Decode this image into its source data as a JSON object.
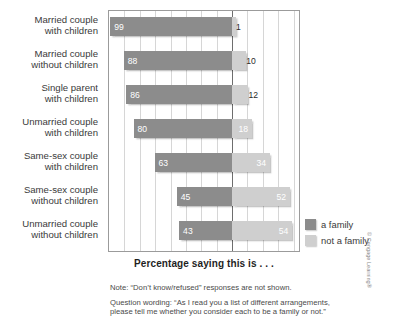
{
  "chart_data": {
    "type": "bar",
    "subtype": "diverging-horizontal-paired",
    "title": "",
    "xlabel": "Percentage saying this is . . .",
    "ylabel": "",
    "categories": [
      "Married couple with children",
      "Married couple without children",
      "Single parent with children",
      "Unmarried couple with children",
      "Same-sex couple with children",
      "Same-sex couple without children",
      "Unmarried couple without children"
    ],
    "series": [
      {
        "name": "a family",
        "color": "#8c8c8c",
        "direction": "left",
        "values": [
          99,
          88,
          86,
          80,
          63,
          45,
          43
        ]
      },
      {
        "name": "not a family",
        "color": "#cfcfcf",
        "direction": "right",
        "values": [
          1,
          10,
          12,
          18,
          34,
          52,
          54
        ]
      }
    ],
    "axis_max_left": 100,
    "axis_max_right": 60,
    "grid": true,
    "gridline_step": 12.5,
    "legend_position": "right",
    "units": "percent"
  },
  "labels": [
    {
      "line1": "Married couple",
      "line2": "with children"
    },
    {
      "line1": "Married couple",
      "line2": "without children"
    },
    {
      "line1": "Single parent",
      "line2": "with children"
    },
    {
      "line1": "Unmarried couple",
      "line2": "with children"
    },
    {
      "line1": "Same-sex couple",
      "line2": "with children"
    },
    {
      "line1": "Same-sex couple",
      "line2": "without children"
    },
    {
      "line1": "Unmarried couple",
      "line2": "without children"
    }
  ],
  "values": {
    "family": [
      "99",
      "88",
      "86",
      "80",
      "63",
      "45",
      "43"
    ],
    "not_family": [
      "1",
      "10",
      "12",
      "18",
      "34",
      "52",
      "54"
    ]
  },
  "axis": {
    "title": "Percentage saying this is . . ."
  },
  "legend": {
    "items": [
      {
        "label": "a family",
        "color": "#8c8c8c"
      },
      {
        "label": "not a family",
        "color": "#cfcfcf"
      }
    ]
  },
  "notes": {
    "note1": "Note: “Don’t know/refused” responses are not shown.",
    "note2_line1": "Question wording: “As I read you a list of different arrangements,",
    "note2_line2": "please tell me whether you consider each to be a family or not.”"
  },
  "credit": "© Cengage Learning®"
}
